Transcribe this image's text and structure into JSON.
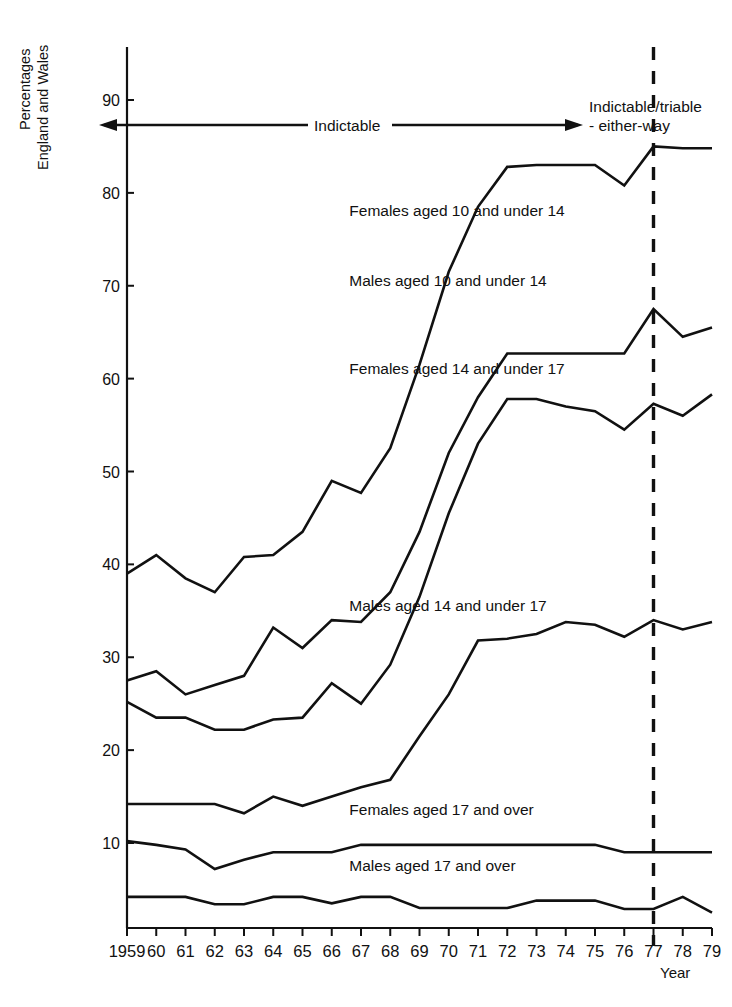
{
  "figure": {
    "y_axis_title_line1": "Percentages",
    "y_axis_title_line2": "England and Wales",
    "x_axis_title": "Year",
    "caption": ""
  },
  "annotations": {
    "left_span_label": "Indictable",
    "right_label_line1": "Indictable/triable",
    "right_label_line2": "- either-way",
    "regime_change_year": "77"
  },
  "chart_data": {
    "type": "line",
    "title": "",
    "xlabel": "Year",
    "ylabel": "Percentages England and Wales",
    "grid": false,
    "legend": "inline-labels",
    "xlim": [
      1959,
      1979
    ],
    "ylim": [
      0,
      95
    ],
    "yticks": [
      10,
      20,
      30,
      40,
      50,
      60,
      70,
      80,
      90
    ],
    "ytick_labels": [
      "10",
      "20",
      "30",
      "40",
      "50",
      "60",
      "70",
      "80",
      "90"
    ],
    "x": [
      1959,
      1960,
      1961,
      1962,
      1963,
      1964,
      1965,
      1966,
      1967,
      1968,
      1969,
      1970,
      1971,
      1972,
      1973,
      1974,
      1975,
      1976,
      1977,
      1978,
      1979
    ],
    "xtick_labels": [
      "1959",
      "60",
      "61",
      "62",
      "63",
      "64",
      "65",
      "66",
      "67",
      "68",
      "69",
      "70",
      "71",
      "72",
      "73",
      "74",
      "75",
      "76",
      "77",
      "78",
      "79"
    ],
    "series": [
      {
        "name": "Females aged 10 and under 14",
        "label_x": 1966.6,
        "label_y": 77.5,
        "values": [
          39.0,
          41.0,
          38.5,
          37.0,
          40.8,
          41.0,
          43.5,
          49.0,
          47.7,
          52.5,
          61.5,
          71.5,
          78.5,
          82.8,
          83.0,
          83.0,
          83.0,
          80.8,
          85.0,
          84.8,
          84.8
        ]
      },
      {
        "name": "Males aged 10 and under 14",
        "label_x": 1966.6,
        "label_y": 70.0,
        "values": [
          27.5,
          28.5,
          26.0,
          27.0,
          28.0,
          33.2,
          31.0,
          34.0,
          33.8,
          37.0,
          43.5,
          52.0,
          58.0,
          62.7,
          62.7,
          62.7,
          62.7,
          62.7,
          67.5,
          64.5,
          65.5
        ]
      },
      {
        "name": "Females aged 14 and under 17",
        "label_x": 1966.6,
        "label_y": 60.5,
        "values": [
          25.2,
          23.5,
          23.5,
          22.2,
          22.2,
          23.3,
          23.5,
          27.2,
          25.0,
          29.2,
          36.5,
          45.5,
          53.0,
          57.8,
          57.8,
          57.0,
          56.5,
          54.5,
          57.3,
          56.0,
          58.3
        ]
      },
      {
        "name": "Males aged 14 and under 17",
        "label_x": 1966.6,
        "label_y": 35.0,
        "values": [
          14.2,
          14.2,
          14.2,
          14.2,
          13.2,
          15.0,
          14.0,
          15.0,
          16.0,
          16.8,
          21.5,
          26.0,
          31.8,
          32.0,
          32.5,
          33.8,
          33.5,
          32.2,
          34.0,
          33.0,
          33.8
        ]
      },
      {
        "name": "Females aged 17 and over",
        "label_x": 1966.6,
        "label_y": 13.0,
        "values": [
          10.2,
          9.8,
          9.3,
          7.2,
          8.2,
          9.0,
          9.0,
          9.0,
          9.8,
          9.8,
          9.8,
          9.8,
          9.8,
          9.8,
          9.8,
          9.8,
          9.8,
          9.0,
          9.0,
          9.0,
          9.0
        ]
      },
      {
        "name": "Males aged 17 and over",
        "label_x": 1966.6,
        "label_y": 7.0,
        "values": [
          4.2,
          4.2,
          4.2,
          3.4,
          3.4,
          4.2,
          4.2,
          3.5,
          4.2,
          4.2,
          3.0,
          3.0,
          3.0,
          3.0,
          3.8,
          3.8,
          3.8,
          2.9,
          2.9,
          4.2,
          2.5
        ]
      }
    ]
  }
}
